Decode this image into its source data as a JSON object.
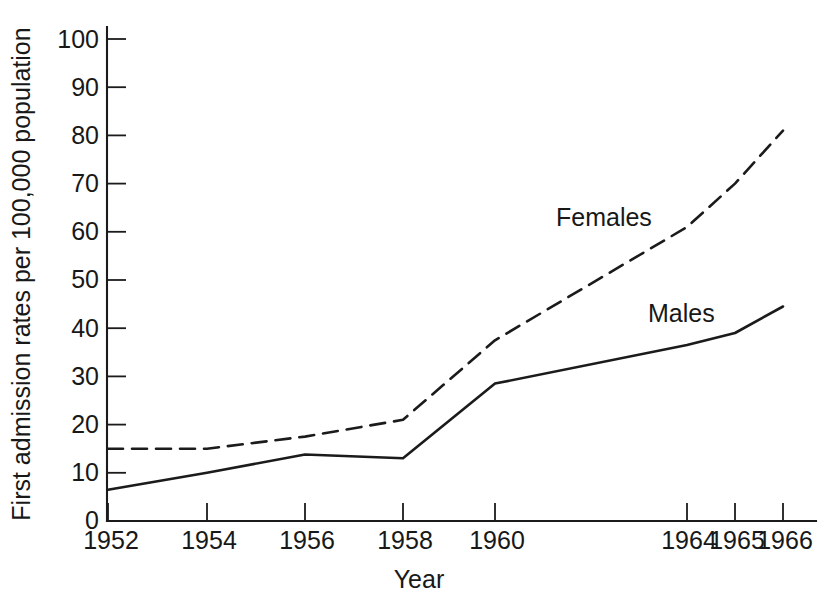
{
  "figure": {
    "background_color": "#ffffff",
    "ink_color": "#1b1b1b"
  },
  "axes": {
    "y_axis_title": "First admission rates per 100,000 population",
    "x_axis_title": "Year",
    "y_tick_labels": [
      "0",
      "10",
      "20",
      "30",
      "40",
      "50",
      "60",
      "70",
      "80",
      "90",
      "100"
    ],
    "x_tick_labels": [
      "1952",
      "1954",
      "1956",
      "1958",
      "1960",
      "1964",
      "1965",
      "1966"
    ]
  },
  "series_labels": {
    "females": "Females",
    "males": "Males"
  },
  "chart_data": {
    "type": "line",
    "title": "",
    "xlabel": "Year",
    "ylabel": "First admission rates per 100,000 population",
    "x": [
      1952,
      1954,
      1956,
      1958,
      1960,
      1964,
      1965,
      1966
    ],
    "xtick_labels": [
      "1952",
      "1954",
      "1956",
      "1958",
      "1960",
      "1964",
      "1965",
      "1966"
    ],
    "ylim": [
      0,
      100
    ],
    "ytick_values": [
      0,
      10,
      20,
      30,
      40,
      50,
      60,
      70,
      80,
      90,
      100
    ],
    "grid": false,
    "legend": "inline-annotations",
    "series": [
      {
        "name": "Females",
        "style": "dashed",
        "values": [
          15,
          15,
          17.5,
          21,
          37.5,
          61,
          70,
          81
        ]
      },
      {
        "name": "Males",
        "style": "solid",
        "values": [
          6.5,
          10,
          13.8,
          13,
          28.5,
          36.5,
          39,
          44.5
        ]
      }
    ],
    "annotations": [
      {
        "text": "Females",
        "x_px": 556,
        "y_px": 226
      },
      {
        "text": "Males",
        "x_px": 648,
        "y_px": 322
      }
    ]
  }
}
